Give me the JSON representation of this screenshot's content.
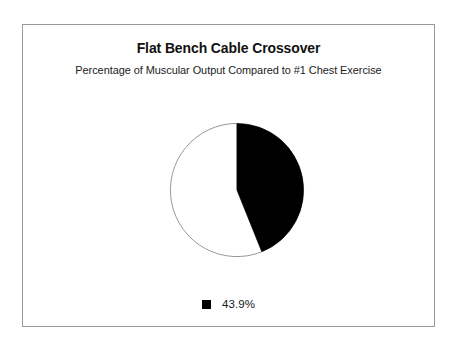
{
  "chart_data": {
    "type": "pie",
    "title": "Flat Bench Cable Crossover",
    "subtitle": "Percentage of Muscular Output Compared to #1 Chest Exercise",
    "categories": [
      "43.9%"
    ],
    "values": [
      43.9
    ],
    "value_labels": [
      "43.9%"
    ],
    "slice_colors": [
      "#000000"
    ],
    "remainder_value": 56.1,
    "remainder_color": "#ffffff",
    "start_angle_deg": 0,
    "direction": "clockwise",
    "legend": {
      "position": "bottom",
      "entries": [
        {
          "swatch_color": "#000000",
          "label": "43.9%"
        }
      ]
    },
    "grid": false,
    "xlabel": "",
    "ylabel": ""
  },
  "frame": {
    "border_color": "#9a9a9a",
    "background": "#ffffff"
  }
}
